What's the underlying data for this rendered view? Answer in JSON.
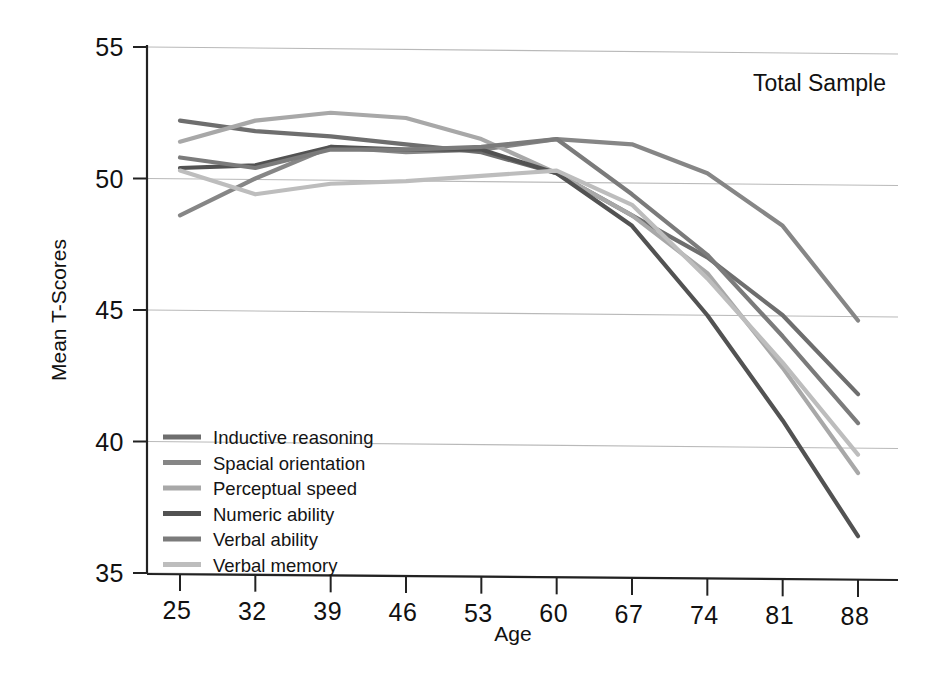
{
  "chart_data": {
    "type": "line",
    "title": "",
    "annotation": "Total Sample",
    "xlabel": "Age",
    "ylabel": "Mean T-Scores",
    "categories": [
      25,
      32,
      39,
      46,
      53,
      60,
      67,
      74,
      81,
      88
    ],
    "x_tick_labels": [
      "25",
      "32",
      "39",
      "46",
      "53",
      "60",
      "67",
      "74",
      "81",
      "88"
    ],
    "y_tick_labels": [
      "35",
      "40",
      "45",
      "50",
      "55"
    ],
    "y_ticks": [
      35,
      40,
      45,
      50,
      55
    ],
    "ylim": [
      35,
      55
    ],
    "xlim": [
      25,
      88
    ],
    "grid": "horizontal",
    "legend_position": "lower-left-inside",
    "series": [
      {
        "name": "Inductive reasoning",
        "color": "#6e6e6e",
        "values": [
          52.2,
          51.8,
          51.6,
          51.3,
          51.0,
          50.2,
          48.6,
          47.0,
          44.8,
          41.8
        ]
      },
      {
        "name": "Spacial orientation",
        "color": "#868686",
        "values": [
          48.6,
          50.0,
          51.2,
          51.0,
          51.1,
          51.5,
          51.3,
          50.2,
          48.2,
          44.6
        ]
      },
      {
        "name": "Perceptual speed",
        "color": "#a8a8a8",
        "values": [
          51.4,
          52.2,
          52.5,
          52.3,
          51.5,
          50.2,
          48.6,
          46.4,
          42.8,
          38.8
        ]
      },
      {
        "name": "Numeric ability",
        "color": "#525252",
        "values": [
          50.4,
          50.5,
          51.2,
          51.1,
          51.1,
          50.2,
          48.2,
          44.8,
          40.8,
          36.4
        ]
      },
      {
        "name": "Verbal ability",
        "color": "#7b7b7b",
        "values": [
          50.8,
          50.4,
          51.1,
          51.1,
          51.2,
          51.5,
          49.4,
          47.1,
          44.0,
          40.7
        ]
      },
      {
        "name": "Verbal memory",
        "color": "#bdbdbd",
        "values": [
          50.3,
          49.4,
          49.8,
          49.9,
          50.1,
          50.3,
          49.0,
          46.2,
          43.0,
          39.5
        ]
      }
    ]
  }
}
